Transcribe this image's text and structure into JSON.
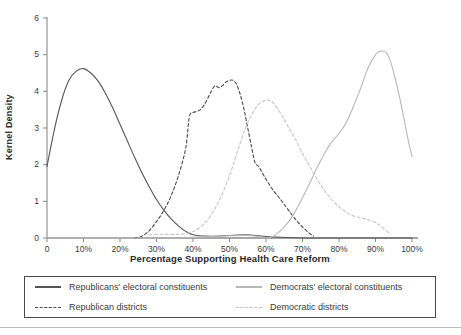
{
  "chart_data": {
    "type": "line",
    "title": "",
    "xlabel": "Percentage Supporting Health Care Reform",
    "ylabel": "Kernel Density",
    "xlim": [
      0,
      100
    ],
    "ylim": [
      0,
      6
    ],
    "xtick_labels": [
      "0",
      "10%",
      "20%",
      "30%",
      "40%",
      "50%",
      "60%",
      "70%",
      "80%",
      "90%",
      "100%"
    ],
    "xtick_values": [
      0,
      10,
      20,
      30,
      40,
      50,
      60,
      70,
      80,
      90,
      100
    ],
    "ytick_labels": [
      "0",
      "1",
      "2",
      "3",
      "4",
      "5",
      "6"
    ],
    "ytick_values": [
      0,
      1,
      2,
      3,
      4,
      5,
      6
    ],
    "grid": false,
    "legend_position": "below-plot",
    "series": [
      {
        "name": "Republicans' electoral constituents",
        "style": "solid",
        "color": "#555555",
        "x": [
          0,
          2,
          4,
          6,
          8,
          10,
          12,
          14,
          16,
          18,
          20,
          22,
          24,
          26,
          28,
          30,
          32,
          34,
          36,
          38,
          40,
          44,
          48,
          50,
          52,
          54,
          56,
          58,
          60,
          64,
          70,
          80,
          90,
          100
        ],
        "y": [
          1.95,
          2.95,
          3.75,
          4.3,
          4.55,
          4.62,
          4.5,
          4.28,
          3.95,
          3.55,
          3.1,
          2.65,
          2.2,
          1.78,
          1.4,
          1.05,
          0.76,
          0.52,
          0.33,
          0.18,
          0.09,
          0.05,
          0.06,
          0.07,
          0.08,
          0.09,
          0.08,
          0.06,
          0.04,
          0.02,
          0.0,
          0.0,
          0.0,
          0.0
        ]
      },
      {
        "name": "Republican districts",
        "style": "dashed",
        "color": "#4a4a4a",
        "x": [
          24,
          26,
          28,
          30,
          32,
          34,
          36,
          38,
          39,
          40,
          41,
          42,
          43,
          44,
          45,
          46,
          47,
          48,
          49,
          50,
          51,
          52,
          53,
          54,
          55,
          56,
          57,
          58,
          60,
          62,
          64,
          66,
          68,
          70,
          72,
          73
        ],
        "y": [
          0.0,
          0.05,
          0.2,
          0.45,
          0.75,
          1.15,
          1.7,
          2.45,
          3.3,
          3.42,
          3.45,
          3.5,
          3.62,
          3.8,
          4.0,
          4.15,
          4.1,
          4.15,
          4.25,
          4.3,
          4.3,
          4.18,
          3.9,
          3.5,
          3.0,
          2.5,
          2.05,
          1.95,
          1.6,
          1.3,
          1.05,
          0.78,
          0.52,
          0.3,
          0.12,
          0.05
        ]
      },
      {
        "name": "Democrats' electoral constituents",
        "style": "solid",
        "color": "#b8b8b8",
        "x": [
          0,
          30,
          40,
          50,
          55,
          58,
          60,
          62,
          64,
          66,
          68,
          70,
          72,
          74,
          76,
          78,
          80,
          82,
          84,
          86,
          88,
          90,
          91,
          92,
          93,
          94,
          95,
          96,
          97,
          98,
          99,
          100
        ],
        "y": [
          0.0,
          0.0,
          0.02,
          0.06,
          0.07,
          0.04,
          0.0,
          0.05,
          0.2,
          0.42,
          0.72,
          1.1,
          1.5,
          1.92,
          2.3,
          2.62,
          2.85,
          3.15,
          3.6,
          4.1,
          4.65,
          5.0,
          5.08,
          5.1,
          5.05,
          4.85,
          4.5,
          4.1,
          3.65,
          3.15,
          2.65,
          2.22
        ]
      },
      {
        "name": "Democratic districts",
        "style": "dashed",
        "color": "#c5c5c5",
        "x": [
          28,
          30,
          32,
          34,
          36,
          38,
          40,
          42,
          44,
          46,
          48,
          50,
          52,
          54,
          56,
          58,
          60,
          61,
          62,
          64,
          66,
          68,
          70,
          72,
          74,
          76,
          78,
          80,
          82,
          84,
          86,
          88,
          90,
          92,
          94
        ],
        "y": [
          0.08,
          0.1,
          0.1,
          0.1,
          0.1,
          0.12,
          0.18,
          0.3,
          0.5,
          0.8,
          1.2,
          1.7,
          2.3,
          2.9,
          3.35,
          3.65,
          3.76,
          3.75,
          3.68,
          3.4,
          3.05,
          2.7,
          2.3,
          1.95,
          1.6,
          1.3,
          1.05,
          0.85,
          0.7,
          0.6,
          0.55,
          0.5,
          0.42,
          0.28,
          0.1
        ]
      }
    ]
  },
  "axis": {
    "x_title": "Percentage Supporting Health Care Reform",
    "y_title": "Kernel Density"
  },
  "legend": {
    "items": [
      {
        "label": "Republicans' electoral constituents",
        "color": "#555555",
        "style": "solid"
      },
      {
        "label": "Democrats' electoral constituents",
        "color": "#b8b8b8",
        "style": "solid"
      },
      {
        "label": "Republican districts",
        "color": "#4a4a4a",
        "style": "dashed"
      },
      {
        "label": "Democratic districts",
        "color": "#c5c5c5",
        "style": "dashed"
      }
    ]
  }
}
